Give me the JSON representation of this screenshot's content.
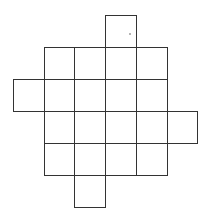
{
  "diagram": {
    "type": "net-of-squares",
    "canvas": {
      "width": 209,
      "height": 218
    },
    "grid": {
      "origin_x": 13,
      "origin_y": 15,
      "cell_width": 30.7,
      "cell_height": 32,
      "columns": 6,
      "rows": 6
    },
    "line_color": "#333333",
    "fill_color": "#ffffff",
    "cells": [
      {
        "col": 3,
        "row": 0
      },
      {
        "col": 1,
        "row": 1
      },
      {
        "col": 2,
        "row": 1
      },
      {
        "col": 3,
        "row": 1
      },
      {
        "col": 4,
        "row": 1
      },
      {
        "col": 0,
        "row": 2
      },
      {
        "col": 1,
        "row": 2
      },
      {
        "col": 2,
        "row": 2
      },
      {
        "col": 3,
        "row": 2
      },
      {
        "col": 4,
        "row": 2
      },
      {
        "col": 1,
        "row": 3
      },
      {
        "col": 2,
        "row": 3
      },
      {
        "col": 3,
        "row": 3
      },
      {
        "col": 4,
        "row": 3
      },
      {
        "col": 5,
        "row": 3
      },
      {
        "col": 1,
        "row": 4
      },
      {
        "col": 2,
        "row": 4
      },
      {
        "col": 3,
        "row": 4
      },
      {
        "col": 4,
        "row": 4
      },
      {
        "col": 2,
        "row": 5
      }
    ],
    "cell_count": 20,
    "marks": [
      {
        "type": "dot",
        "x": 130,
        "y": 34
      }
    ]
  }
}
